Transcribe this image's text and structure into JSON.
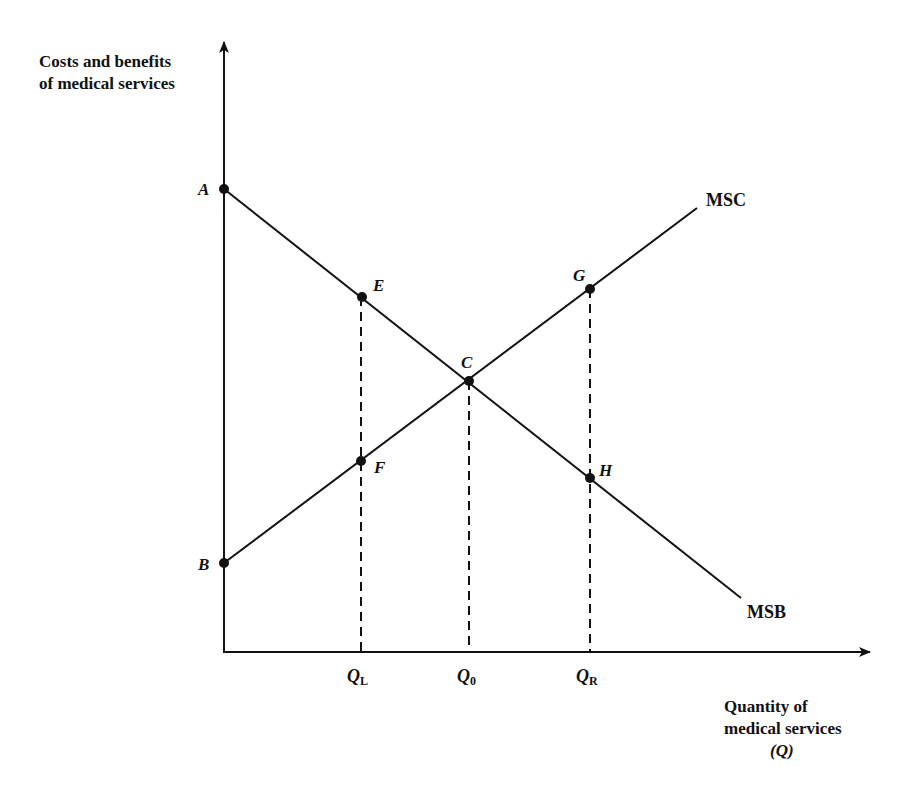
{
  "diagram": {
    "y_axis_label": [
      "Costs and benefits",
      "of medical services"
    ],
    "x_axis_label": [
      "Quantity of",
      "medical services",
      "(Q)"
    ],
    "curves": [
      {
        "name": "MSC",
        "label": "MSC",
        "from": "B",
        "to_end": [
          697,
          208
        ]
      },
      {
        "name": "MSB",
        "label": "MSB",
        "from": "A",
        "to_end": [
          741,
          598
        ]
      }
    ],
    "points": {
      "A": {
        "label": "A",
        "x": 224,
        "y": 189
      },
      "B": {
        "label": "B",
        "x": 224,
        "y": 563
      },
      "C": {
        "label": "C",
        "x": 469,
        "y": 381
      },
      "E": {
        "label": "E",
        "x": 362,
        "y": 297
      },
      "F": {
        "label": "F",
        "x": 361,
        "y": 461
      },
      "G": {
        "label": "G",
        "x": 590,
        "y": 289
      },
      "H": {
        "label": "H",
        "x": 590,
        "y": 478
      }
    },
    "x_ticks": [
      {
        "main": "Q",
        "sub": "L",
        "x": 361
      },
      {
        "main": "Q",
        "sub": "0",
        "x": 469
      },
      {
        "main": "Q",
        "sub": "R",
        "x": 590
      }
    ],
    "line_color": "#111111",
    "background": "#ffffff"
  }
}
